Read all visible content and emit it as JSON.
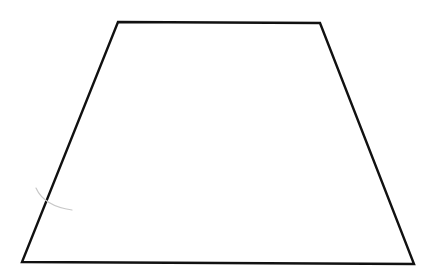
{
  "diagram": {
    "shape": "trapezoid",
    "stroke_color": "#111111",
    "stroke_width": 2.4,
    "fill_color": "#ffffff",
    "vertices": {
      "top_left": [
        118,
        22
      ],
      "top_right": [
        320,
        23
      ],
      "bottom_right": [
        414,
        264
      ],
      "bottom_left": [
        22,
        262
      ]
    },
    "construction_arc": {
      "color": "#c8c8c8",
      "path": "M 36 188 Q 44 206 72 210"
    }
  }
}
